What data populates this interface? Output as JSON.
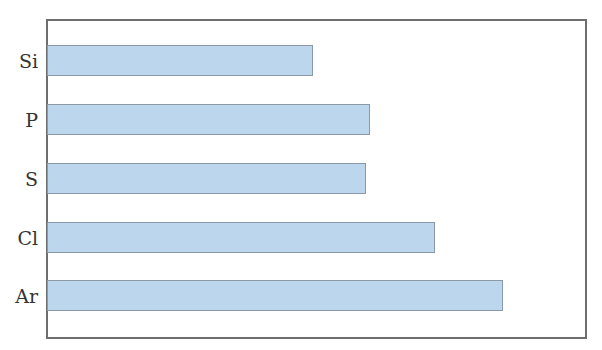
{
  "chart_data": {
    "type": "bar",
    "orientation": "horizontal",
    "title": "",
    "xlabel": "",
    "ylabel": "",
    "categories": [
      "Si",
      "P",
      "S",
      "Cl",
      "Ar"
    ],
    "values": [
      266,
      323,
      319,
      388,
      456
    ],
    "value_units": "relative bar length (px, no axis scale shown)",
    "axis_max": 538,
    "grid": false,
    "legend": null,
    "bar_color": "#bcd6ee",
    "bar_border_color": "#8a98a8",
    "frame_color": "#6e6e6e"
  },
  "bars": [
    {
      "label": "Si",
      "top": 45,
      "width": 266
    },
    {
      "label": "P",
      "top": 104,
      "width": 323
    },
    {
      "label": "S",
      "top": 163,
      "width": 319
    },
    {
      "label": "Cl",
      "top": 222,
      "width": 388
    },
    {
      "label": "Ar",
      "top": 280,
      "width": 456
    }
  ]
}
